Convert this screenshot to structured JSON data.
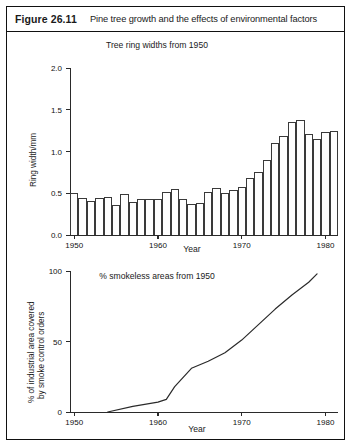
{
  "figure": {
    "number": "Figure 26.11",
    "caption": "Pine tree growth and the effects of environmental factors"
  },
  "chart_data": [
    {
      "id": "tree-ring-widths",
      "type": "bar",
      "title": "Tree ring widths from 1950",
      "xlabel": "Year",
      "ylabel": "Ring width/mm",
      "xlim": [
        1949.5,
        1981.5
      ],
      "ylim": [
        0.0,
        2.0
      ],
      "ytick_labels": [
        "2.0",
        "1.5",
        "1.0",
        "0.5",
        "0.0"
      ],
      "yticks": [
        2.0,
        1.5,
        1.0,
        0.5,
        0.0
      ],
      "xtick_labels": [
        "1950",
        "1960",
        "1970",
        "1980"
      ],
      "xticks": [
        1950,
        1960,
        1970,
        1980
      ],
      "grid": false,
      "legend": "none",
      "categories": [
        1950,
        1951,
        1952,
        1953,
        1954,
        1955,
        1956,
        1957,
        1958,
        1959,
        1960,
        1961,
        1962,
        1963,
        1964,
        1965,
        1966,
        1967,
        1968,
        1969,
        1970,
        1971,
        1972,
        1973,
        1974,
        1975,
        1976,
        1977,
        1978,
        1979,
        1980,
        1981
      ],
      "values": [
        0.5,
        0.44,
        0.41,
        0.44,
        0.46,
        0.36,
        0.49,
        0.39,
        0.43,
        0.43,
        0.43,
        0.51,
        0.55,
        0.43,
        0.37,
        0.38,
        0.52,
        0.56,
        0.5,
        0.54,
        0.58,
        0.68,
        0.76,
        0.9,
        1.1,
        1.18,
        1.35,
        1.38,
        1.21,
        1.15,
        1.23,
        1.25
      ]
    },
    {
      "id": "smokeless-areas",
      "type": "line",
      "title": "% smokeless areas from 1950",
      "xlabel": "Year",
      "ylabel": "% of industrial area covered by smoke control orders",
      "xlim": [
        1949.5,
        1981.5
      ],
      "ylim": [
        0,
        100
      ],
      "ytick_labels": [
        "100",
        "50",
        "0"
      ],
      "yticks": [
        100,
        50,
        0
      ],
      "xtick_labels": [
        "1950",
        "1960",
        "1970",
        "1980"
      ],
      "xticks": [
        1950,
        1960,
        1970,
        1980
      ],
      "grid": false,
      "legend": "none",
      "x": [
        1954,
        1957,
        1960,
        1961,
        1962,
        1964,
        1966,
        1968,
        1970,
        1972,
        1974,
        1976,
        1978,
        1979
      ],
      "y": [
        0,
        4,
        7,
        9,
        18,
        31,
        36,
        42,
        51,
        62,
        73,
        83,
        92,
        98
      ]
    }
  ]
}
